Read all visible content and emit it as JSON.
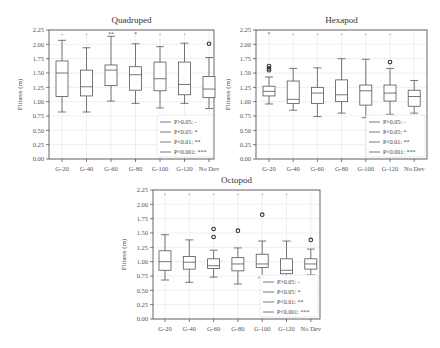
{
  "chart_data": [
    {
      "type": "box",
      "title": "Quadruped",
      "xlabel": "",
      "ylabel": "Fitness (m)",
      "ylim": [
        0,
        2.25
      ],
      "yticks": [
        "0.00",
        "0.25",
        "0.50",
        "0.75",
        "1.00",
        "1.25",
        "1.50",
        "1.75",
        "2.00",
        "2.25"
      ],
      "grid": true,
      "categories": [
        "G-20",
        "G-40",
        "G-60",
        "G-80",
        "G-100",
        "G-120",
        "No Dev"
      ],
      "boxes": [
        {
          "whislo": 0.82,
          "q1": 1.09,
          "med": 1.5,
          "q3": 1.71,
          "whishi": 2.07,
          "fliers": []
        },
        {
          "whislo": 0.82,
          "q1": 1.1,
          "med": 1.26,
          "q3": 1.55,
          "whishi": 1.94,
          "fliers": []
        },
        {
          "whislo": 1.01,
          "q1": 1.28,
          "med": 1.55,
          "q3": 1.64,
          "whishi": 2.14,
          "fliers": []
        },
        {
          "whislo": 0.97,
          "q1": 1.2,
          "med": 1.47,
          "q3": 1.61,
          "whishi": 2.01,
          "fliers": []
        },
        {
          "whislo": 0.89,
          "q1": 1.19,
          "med": 1.4,
          "q3": 1.69,
          "whishi": 1.96,
          "fliers": []
        },
        {
          "whislo": 0.97,
          "q1": 1.12,
          "med": 1.3,
          "q3": 1.69,
          "whishi": 2.02,
          "fliers": []
        },
        {
          "whislo": 0.88,
          "q1": 1.07,
          "med": 1.22,
          "q3": 1.44,
          "whishi": 1.77,
          "fliers": [
            2.01
          ]
        }
      ],
      "significance": [
        "-",
        "-",
        "**",
        "*",
        "-",
        "-",
        ""
      ],
      "legend": [
        "P>0.05: -",
        "P<0.05: *",
        "P<0.01: **",
        "P<0.001: ***"
      ],
      "legend_position": "lower right"
    },
    {
      "type": "box",
      "title": "Hexapod",
      "xlabel": "",
      "ylabel": "Fitness (m)",
      "ylim": [
        0,
        2.25
      ],
      "yticks": [
        "0.00",
        "0.25",
        "0.50",
        "0.75",
        "1.00",
        "1.25",
        "1.50",
        "1.75",
        "2.00",
        "2.25"
      ],
      "grid": true,
      "categories": [
        "G-20",
        "G-40",
        "G-60",
        "G-80",
        "G-100",
        "G-120",
        "No Dev"
      ],
      "boxes": [
        {
          "whislo": 0.96,
          "q1": 1.1,
          "med": 1.18,
          "q3": 1.27,
          "whishi": 1.43,
          "fliers": [
            1.55,
            1.58,
            1.62
          ]
        },
        {
          "whislo": 0.85,
          "q1": 0.97,
          "med": 1.04,
          "q3": 1.36,
          "whishi": 1.58,
          "fliers": []
        },
        {
          "whislo": 0.74,
          "q1": 0.97,
          "med": 1.15,
          "q3": 1.25,
          "whishi": 1.59,
          "fliers": []
        },
        {
          "whislo": 0.8,
          "q1": 1.0,
          "med": 1.12,
          "q3": 1.38,
          "whishi": 1.75,
          "fliers": []
        },
        {
          "whislo": 0.72,
          "q1": 0.94,
          "med": 1.19,
          "q3": 1.29,
          "whishi": 1.74,
          "fliers": []
        },
        {
          "whislo": 0.78,
          "q1": 1.01,
          "med": 1.15,
          "q3": 1.29,
          "whishi": 1.58,
          "fliers": [
            1.69
          ]
        },
        {
          "whislo": 0.8,
          "q1": 0.92,
          "med": 1.09,
          "q3": 1.2,
          "whishi": 1.37,
          "fliers": []
        }
      ],
      "significance": [
        "*",
        "-",
        "-",
        "-",
        "-",
        "-",
        ""
      ],
      "legend": [
        "P>0.05: -",
        "P<0.05: *",
        "P<0.01: **",
        "P<0.001: ***"
      ],
      "legend_position": "lower right"
    },
    {
      "type": "box",
      "title": "Octopod",
      "xlabel": "",
      "ylabel": "Fitness (m)",
      "ylim": [
        0,
        2.25
      ],
      "yticks": [
        "0.00",
        "0.25",
        "0.50",
        "0.75",
        "1.00",
        "1.25",
        "1.50",
        "1.75",
        "2.00",
        "2.25"
      ],
      "grid": true,
      "categories": [
        "G-20",
        "G-40",
        "G-60",
        "G-80",
        "G-100",
        "G-120",
        "No Dev"
      ],
      "boxes": [
        {
          "whislo": 0.68,
          "q1": 0.85,
          "med": 1.0,
          "q3": 1.19,
          "whishi": 1.47,
          "fliers": []
        },
        {
          "whislo": 0.64,
          "q1": 0.87,
          "med": 0.99,
          "q3": 1.09,
          "whishi": 1.38,
          "fliers": []
        },
        {
          "whislo": 0.73,
          "q1": 0.88,
          "med": 0.93,
          "q3": 1.05,
          "whishi": 1.2,
          "fliers": [
            1.43,
            1.57
          ]
        },
        {
          "whislo": 0.61,
          "q1": 0.84,
          "med": 0.96,
          "q3": 1.07,
          "whishi": 1.24,
          "fliers": [
            1.54
          ]
        },
        {
          "whislo": 0.72,
          "q1": 0.9,
          "med": 0.96,
          "q3": 1.13,
          "whishi": 1.36,
          "fliers": [
            1.82
          ]
        },
        {
          "whislo": 0.72,
          "q1": 0.79,
          "med": 0.85,
          "q3": 1.05,
          "whishi": 1.36,
          "fliers": []
        },
        {
          "whislo": 0.77,
          "q1": 0.87,
          "med": 0.96,
          "q3": 1.05,
          "whishi": 1.22,
          "fliers": [
            1.38
          ]
        }
      ],
      "significance": [
        "-",
        "-",
        "-",
        "-",
        "-",
        "-",
        ""
      ],
      "legend": [
        "P>0.05: -",
        "P<0.05: *",
        "P<0.01: **",
        "P<0.001: ***"
      ],
      "legend_position": "lower right"
    }
  ]
}
